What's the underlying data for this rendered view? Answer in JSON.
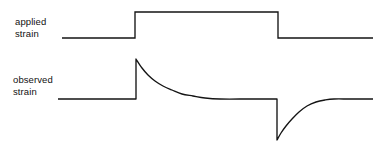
{
  "figure": {
    "background_color": "#ffffff",
    "line_color": "#141414",
    "width": 392,
    "height": 150
  },
  "labels": {
    "applied": {
      "line1": "applied",
      "line2": "strain",
      "full": "applied strain"
    },
    "observed": {
      "line1": "observed",
      "line2": "strain",
      "full": "observed strain"
    }
  },
  "chart_data": {
    "type": "line",
    "title": "",
    "subtitle": "",
    "xlabel": "",
    "ylabel": "",
    "grid": false,
    "legend_position": "left",
    "axes_visible": false,
    "tick_labels_x": [],
    "tick_labels_y": [],
    "xlim": [
      0,
      392
    ],
    "ylim": [
      150,
      0
    ],
    "annotations": [
      "applied strain",
      "observed strain"
    ],
    "series": [
      {
        "name": "applied strain",
        "description": "Rectangular step pulse: constant low baseline, abrupt rise to a high plateau, abrupt fall back to baseline.",
        "shape": "square-pulse",
        "baseline_y": 38,
        "plateau_y": 12,
        "step_up_x": 135,
        "step_down_x": 278,
        "start_x": 62,
        "end_x": 373,
        "points": [
          [
            62,
            38
          ],
          [
            135,
            38
          ],
          [
            135,
            12
          ],
          [
            278,
            12
          ],
          [
            278,
            38
          ],
          [
            373,
            38
          ]
        ]
      },
      {
        "name": "observed strain",
        "description": "Viscoelastic response: instantaneous overshoot spike on loading that relaxes exponentially to baseline, then an instantaneous undershoot spike on unloading that recovers exponentially to baseline.",
        "shape": "spike-relaxation",
        "baseline_y": 99,
        "peak_y": 59,
        "trough_y": 140,
        "spike_up_x": 136,
        "spike_down_x": 277,
        "start_x": 58,
        "end_x": 373,
        "relaxation_end_x": 205,
        "recovery_end_x": 332,
        "points": [
          [
            58,
            99
          ],
          [
            136,
            99
          ],
          [
            136,
            59
          ],
          [
            142,
            68
          ],
          [
            148,
            75
          ],
          [
            155,
            81
          ],
          [
            163,
            86
          ],
          [
            172,
            90
          ],
          [
            182,
            94
          ],
          [
            193,
            96
          ],
          [
            205,
            98
          ],
          [
            220,
            99
          ],
          [
            250,
            99
          ],
          [
            277,
            99
          ],
          [
            277,
            140
          ],
          [
            281,
            133
          ],
          [
            286,
            126
          ],
          [
            292,
            119
          ],
          [
            299,
            112
          ],
          [
            307,
            106
          ],
          [
            316,
            102
          ],
          [
            325,
            100
          ],
          [
            334,
            99
          ],
          [
            350,
            99
          ],
          [
            373,
            99
          ]
        ]
      }
    ]
  }
}
